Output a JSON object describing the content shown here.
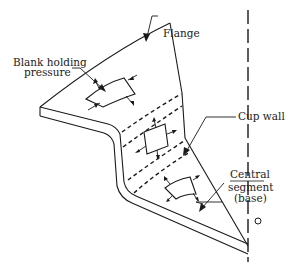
{
  "figure": {
    "type": "schematic diagram",
    "labels": {
      "blank_holding_line1": "Blank holding",
      "blank_holding_line2": "pressure",
      "flange": "Flange",
      "cup_wall": "Cup wall",
      "central_line1": "Central",
      "central_line2": "segment",
      "central_line3": "(base)",
      "origin": "O"
    },
    "regions": [
      {
        "name": "flange",
        "element_shape": "curved trapezoid"
      },
      {
        "name": "cup wall",
        "element_shape": "rectangle"
      },
      {
        "name": "central segment (base)",
        "element_shape": "curved trapezoid"
      }
    ],
    "line_color": "#1a1a1a",
    "background": "#ffffff"
  }
}
